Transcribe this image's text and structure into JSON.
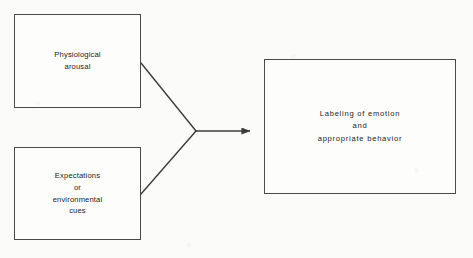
{
  "figure": {
    "background_color": "#fbfbfa",
    "stroke_color": "#4a4a4a",
    "text_color": "#1b1b1b"
  },
  "nodes": [
    {
      "id": "physiological-arousal",
      "label": "Physiological\narousal",
      "x": 14,
      "y": 14,
      "width": 127,
      "height": 94
    },
    {
      "id": "expectations-cues",
      "label": "Expectations\nor\nenvironmental\ncues",
      "x": 14,
      "y": 147,
      "width": 127,
      "height": 93
    },
    {
      "id": "labeling-emotion",
      "label": "Labeling of emotion\nand\nappropriate behavior",
      "x": 264,
      "y": 59,
      "width": 192,
      "height": 135
    }
  ],
  "connectors": {
    "junction_x": 196,
    "junction_y": 131,
    "arrow_tip_x": 250,
    "upper_line_start_x": 141,
    "upper_line_start_y": 63,
    "lower_line_start_x": 141,
    "lower_line_start_y": 194,
    "stroke_color": "#3c3c3c",
    "stroke_width": 1.4
  }
}
